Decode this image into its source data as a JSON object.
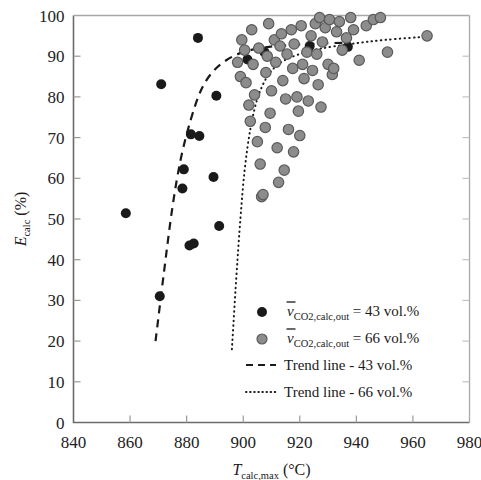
{
  "chart_data": {
    "type": "scatter",
    "title": "",
    "xlabel": "T_calc,max (°C)",
    "ylabel": "E_calc (%)",
    "xlim": [
      840,
      980
    ],
    "ylim": [
      0,
      100
    ],
    "xticks": [
      840,
      860,
      880,
      900,
      920,
      940,
      960,
      980
    ],
    "yticks": [
      0,
      10,
      20,
      30,
      40,
      50,
      60,
      70,
      80,
      90,
      100
    ],
    "grid": false,
    "legend_position": "lower-right-inside",
    "series": [
      {
        "name": "v_CO2,calc,out = 43 vol.%",
        "marker": "filled-circle",
        "color": "#1a1a1a",
        "points": [
          [
            858.5,
            51.4
          ],
          [
            871.0,
            83.1
          ],
          [
            870.5,
            31.0
          ],
          [
            879.0,
            62.2
          ],
          [
            878.5,
            57.5
          ],
          [
            881.0,
            43.5
          ],
          [
            882.5,
            44.0
          ],
          [
            881.5,
            70.8
          ],
          [
            884.5,
            70.4
          ],
          [
            884.0,
            94.5
          ],
          [
            890.5,
            80.3
          ],
          [
            889.5,
            60.3
          ],
          [
            891.5,
            48.3
          ],
          [
            901.5,
            89.2
          ],
          [
            907.5,
            91.0
          ],
          [
            923.5,
            92.5
          ],
          [
            937.0,
            92.3
          ]
        ]
      },
      {
        "name": "v_CO2,calc,out = 66 vol.%",
        "marker": "gray-circle",
        "color": "#8c8c8c",
        "points": [
          [
            898.0,
            88.5
          ],
          [
            899.0,
            85.0
          ],
          [
            900.5,
            91.5
          ],
          [
            901.0,
            83.5
          ],
          [
            902.0,
            78.0
          ],
          [
            902.5,
            74.0
          ],
          [
            903.5,
            88.0
          ],
          [
            904.0,
            80.5
          ],
          [
            905.0,
            69.0
          ],
          [
            905.5,
            92.0
          ],
          [
            906.0,
            63.5
          ],
          [
            906.5,
            55.5
          ],
          [
            907.0,
            56.0
          ],
          [
            908.0,
            86.0
          ],
          [
            908.5,
            90.0
          ],
          [
            909.5,
            76.0
          ],
          [
            910.0,
            81.5
          ],
          [
            911.0,
            94.0
          ],
          [
            911.5,
            88.5
          ],
          [
            912.0,
            67.5
          ],
          [
            913.0,
            92.5
          ],
          [
            913.5,
            95.5
          ],
          [
            914.0,
            84.0
          ],
          [
            915.0,
            79.5
          ],
          [
            915.5,
            90.5
          ],
          [
            916.0,
            72.0
          ],
          [
            917.0,
            96.5
          ],
          [
            917.5,
            87.0
          ],
          [
            918.0,
            93.0
          ],
          [
            919.0,
            80.0
          ],
          [
            919.5,
            76.5
          ],
          [
            920.5,
            97.5
          ],
          [
            921.0,
            88.0
          ],
          [
            921.5,
            84.5
          ],
          [
            922.5,
            91.0
          ],
          [
            923.0,
            79.0
          ],
          [
            924.0,
            95.0
          ],
          [
            924.5,
            86.5
          ],
          [
            925.5,
            98.0
          ],
          [
            926.0,
            90.5
          ],
          [
            926.5,
            83.0
          ],
          [
            927.5,
            77.5
          ],
          [
            928.0,
            93.5
          ],
          [
            929.0,
            97.0
          ],
          [
            930.0,
            88.0
          ],
          [
            930.5,
            99.0
          ],
          [
            931.5,
            85.5
          ],
          [
            933.0,
            96.0
          ],
          [
            934.0,
            98.5
          ],
          [
            935.0,
            91.5
          ],
          [
            936.5,
            94.5
          ],
          [
            938.0,
            99.5
          ],
          [
            939.0,
            96.5
          ],
          [
            941.0,
            89.0
          ],
          [
            943.5,
            97.5
          ],
          [
            946.0,
            99.0
          ],
          [
            948.5,
            99.5
          ],
          [
            951.0,
            91.0
          ],
          [
            965.0,
            95.0
          ],
          [
            903.0,
            96.5
          ],
          [
            909.0,
            98.0
          ],
          [
            912.5,
            59.0
          ],
          [
            914.5,
            62.0
          ],
          [
            907.8,
            72.5
          ],
          [
            917.8,
            66.5
          ],
          [
            899.5,
            94.0
          ],
          [
            927.0,
            99.5
          ],
          [
            932.0,
            87.0
          ],
          [
            920.0,
            70.5
          ]
        ]
      }
    ],
    "trendlines": [
      {
        "name": "Trend line - 43 vol.%",
        "style": "dashed",
        "color": "#1a1a1a",
        "points": [
          [
            869.0,
            20.0
          ],
          [
            872.0,
            37.0
          ],
          [
            875.0,
            53.0
          ],
          [
            878.0,
            65.0
          ],
          [
            881.5,
            74.5
          ],
          [
            885.0,
            81.5
          ],
          [
            889.0,
            86.0
          ],
          [
            894.0,
            89.0
          ],
          [
            900.0,
            91.0
          ],
          [
            908.0,
            92.2
          ],
          [
            918.0,
            92.8
          ],
          [
            930.0,
            93.2
          ],
          [
            938.0,
            93.3
          ]
        ]
      },
      {
        "name": "Trend line - 66 vol.%",
        "style": "dotted",
        "color": "#1a1a1a",
        "points": [
          [
            896.0,
            18.0
          ],
          [
            897.5,
            35.0
          ],
          [
            899.0,
            50.0
          ],
          [
            900.5,
            62.0
          ],
          [
            902.5,
            72.0
          ],
          [
            905.0,
            79.5
          ],
          [
            908.5,
            85.0
          ],
          [
            913.0,
            88.3
          ],
          [
            919.0,
            90.3
          ],
          [
            927.0,
            91.8
          ],
          [
            938.0,
            93.0
          ],
          [
            950.0,
            94.0
          ],
          [
            965.0,
            94.8
          ]
        ]
      }
    ]
  },
  "axes": {
    "x_tick_labels": [
      "840",
      "860",
      "880",
      "900",
      "920",
      "940",
      "960",
      "980"
    ],
    "y_tick_labels": [
      "0",
      "10",
      "20",
      "30",
      "40",
      "50",
      "60",
      "70",
      "80",
      "90",
      "100"
    ],
    "x_title_symbol": "T",
    "x_title_sub": "calc,max",
    "x_title_unit": "(°C)",
    "y_title_symbol": "E",
    "y_title_sub": "calc",
    "y_title_unit": "(%)"
  },
  "legend": {
    "entries": [
      {
        "id": "series-43",
        "marker": "filled-circle",
        "symbol": "v",
        "subscript": "CO2,calc,out",
        "equals": "= 43 vol.%"
      },
      {
        "id": "series-66",
        "marker": "gray-circle",
        "symbol": "v",
        "subscript": "CO2,calc,out",
        "equals": "= 66 vol.%"
      },
      {
        "id": "trend-43",
        "marker": "dashed-line",
        "label": "Trend line - 43 vol.%"
      },
      {
        "id": "trend-66",
        "marker": "dotted-line",
        "label": "Trend line - 66 vol.%"
      }
    ]
  },
  "colors": {
    "black_marker": "#1a1a1a",
    "gray_marker_fill": "#8c8c8c",
    "gray_marker_stroke": "#5a5a5a",
    "axis": "#6b6b6b",
    "text": "#1a1a1a",
    "background": "#ffffff"
  }
}
